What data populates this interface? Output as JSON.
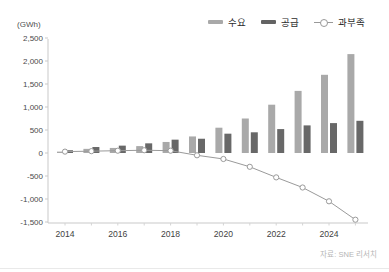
{
  "header": {
    "unit_label": "(GWh)"
  },
  "legend": {
    "items": [
      {
        "label": "수요",
        "swatch": "bar",
        "color": "#a9a9a9"
      },
      {
        "label": "공급",
        "swatch": "bar",
        "color": "#636363"
      },
      {
        "label": "과부족",
        "swatch": "line-circle",
        "color": "#999999"
      }
    ]
  },
  "source": {
    "text": "자료: SNE 리서치"
  },
  "chart_data": {
    "type": "bar",
    "title": "",
    "unit": "GWh",
    "categories": [
      "2014",
      "2015",
      "2016",
      "2017",
      "2018",
      "2019",
      "2020",
      "2021",
      "2022",
      "2023",
      "2024",
      "2025"
    ],
    "series": [
      {
        "name": "수요",
        "type": "bar",
        "color": "#a9a9a9",
        "values": [
          30,
          90,
          110,
          150,
          240,
          360,
          550,
          750,
          1050,
          1350,
          1700,
          2150
        ]
      },
      {
        "name": "공급",
        "type": "bar",
        "color": "#686868",
        "values": [
          60,
          130,
          160,
          210,
          290,
          310,
          420,
          450,
          520,
          600,
          650,
          700
        ]
      },
      {
        "name": "과부족",
        "type": "line",
        "color": "#9a9a9a",
        "marker": "open-circle",
        "values": [
          30,
          40,
          50,
          60,
          50,
          -50,
          -130,
          -300,
          -530,
          -750,
          -1050,
          -1450
        ]
      }
    ],
    "ylim": [
      -1500,
      2500
    ],
    "yticks": [
      {
        "value": 2500,
        "label": "2,500"
      },
      {
        "value": 2000,
        "label": "2,000"
      },
      {
        "value": 1500,
        "label": "1,500"
      },
      {
        "value": 1000,
        "label": "1,000"
      },
      {
        "value": 500,
        "label": "500"
      },
      {
        "value": 0,
        "label": "0"
      },
      {
        "value": -500,
        "label": "-500"
      },
      {
        "value": -1000,
        "label": "-1,000"
      },
      {
        "value": -1500,
        "label": "-1,500"
      }
    ],
    "xtick_labels": [
      "2014",
      "2016",
      "2018",
      "2020",
      "2022",
      "2024"
    ],
    "grid": false,
    "legend_position": "top-right",
    "source": "자료: SNE 리서치"
  }
}
